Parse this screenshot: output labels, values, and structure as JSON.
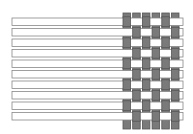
{
  "diagram": {
    "type": "weave-pattern",
    "colors": {
      "weft_fill": "#ffffff",
      "weft_stroke": "#888888",
      "warp_fill": "#7a7a7a",
      "warp_stroke": "#555555",
      "background": "#ffffff"
    },
    "weft": {
      "count": 10,
      "x_start": 12,
      "x_end": 183,
      "y_start": 18,
      "spacing": 10.5,
      "height": 7.5
    },
    "warp": {
      "count": 6,
      "x_start": 123,
      "spacing": 9.7,
      "width": 7.5,
      "y_start": 13,
      "y_end": 129
    }
  }
}
